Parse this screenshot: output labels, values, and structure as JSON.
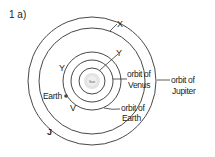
{
  "question_label": "1 a)",
  "diagram": {
    "type": "orbit-diagram",
    "center": "Sun",
    "sun_label": "Sun",
    "labels": {
      "orbit_venus_line1": "orbit of",
      "orbit_venus_line2": "Venus",
      "orbit_earth_line1": "orbit of",
      "orbit_earth_line2": "Earth",
      "orbit_jupiter_line1": "orbit of",
      "orbit_jupiter_line2": "Jupiter",
      "earth": "Earth",
      "marker_x": "X",
      "marker_y_top": "Y",
      "marker_y_left": "Y",
      "marker_v": "V",
      "marker_j": "J"
    },
    "orbits": [
      {
        "name": "sun-ring",
        "radius": 13
      },
      {
        "name": "venus",
        "radius": 21
      },
      {
        "name": "earth",
        "radius": 29
      },
      {
        "name": "x-orbit",
        "radius": 53
      },
      {
        "name": "jupiter",
        "radius": 64
      }
    ],
    "colors": {
      "line": "#333333",
      "sun_fill": "#e0e0e0",
      "text": "#222222"
    }
  }
}
